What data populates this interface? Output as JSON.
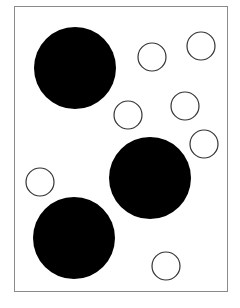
{
  "diagram": {
    "frame": {
      "x": 14,
      "y": 6,
      "width": 215,
      "height": 287,
      "stroke": "#8a8a8a"
    },
    "large_circles": [
      {
        "cx": 75,
        "cy": 68,
        "r": 41,
        "fill": "#000000"
      },
      {
        "cx": 150,
        "cy": 178,
        "r": 41,
        "fill": "#000000"
      },
      {
        "cx": 74,
        "cy": 238,
        "r": 41,
        "fill": "#000000"
      }
    ],
    "small_circles": [
      {
        "cx": 152,
        "cy": 57,
        "r": 14,
        "stroke": "#333333"
      },
      {
        "cx": 201,
        "cy": 46,
        "r": 14,
        "stroke": "#333333"
      },
      {
        "cx": 128,
        "cy": 115,
        "r": 14,
        "stroke": "#333333"
      },
      {
        "cx": 185,
        "cy": 106,
        "r": 14,
        "stroke": "#333333"
      },
      {
        "cx": 204,
        "cy": 144,
        "r": 14,
        "stroke": "#333333"
      },
      {
        "cx": 40,
        "cy": 182,
        "r": 14,
        "stroke": "#333333"
      },
      {
        "cx": 166,
        "cy": 266,
        "r": 14,
        "stroke": "#333333"
      }
    ]
  }
}
